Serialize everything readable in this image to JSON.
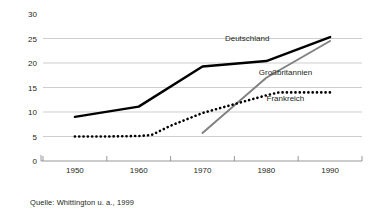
{
  "caption": "Quelle: Whittington u. a., 1999",
  "chart_data": {
    "type": "line",
    "title": "",
    "xlabel": "",
    "ylabel": "",
    "xlim": [
      1945,
      1995
    ],
    "ylim": [
      0,
      30
    ],
    "grid": true,
    "legend_position": "inline-annotations",
    "xticks": [
      1950,
      1960,
      1970,
      1980,
      1990
    ],
    "xtick_labels": [
      "1950",
      "1960",
      "1970",
      "1980",
      "1990"
    ],
    "yticks": [
      0,
      5,
      10,
      15,
      20,
      25,
      30
    ],
    "ytick_labels": [
      "0",
      "5",
      "10",
      "15",
      "20",
      "25",
      "30"
    ],
    "series": [
      {
        "name": "Deutschland",
        "style": "solid-thick-black",
        "color": "#000000",
        "x": [
          1950,
          1960,
          1970,
          1980,
          1990
        ],
        "values": [
          9.0,
          11.1,
          19.3,
          20.4,
          25.3
        ],
        "label_x": 1977,
        "label_y": 24.4
      },
      {
        "name": "Großbritannien",
        "style": "solid-gray",
        "color": "#808080",
        "x": [
          1970,
          1980,
          1990
        ],
        "values": [
          5.7,
          17.0,
          24.5
        ],
        "label_x": 1983,
        "label_y": 17.5
      },
      {
        "name": "Frankreich",
        "style": "dotted-black",
        "color": "#000000",
        "x": [
          1950,
          1955,
          1960,
          1962,
          1965,
          1970,
          1975,
          1980,
          1982,
          1985,
          1990
        ],
        "values": [
          5.0,
          5.0,
          5.1,
          5.3,
          7.2,
          9.8,
          11.6,
          13.4,
          14.0,
          14.0,
          14.0
        ],
        "label_x": 1983,
        "label_y": 12.2
      }
    ]
  }
}
